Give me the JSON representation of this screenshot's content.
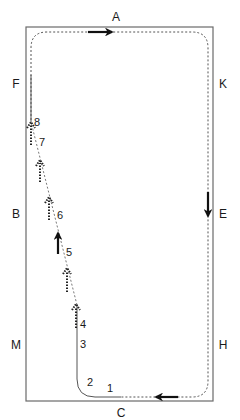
{
  "arena": {
    "letters": {
      "A": "A",
      "K": "K",
      "E": "E",
      "H": "H",
      "C": "C",
      "M": "M",
      "B": "B",
      "F": "F"
    }
  },
  "markers": {
    "m1": "1",
    "m2": "2",
    "m3": "3",
    "m4": "4",
    "m5": "5",
    "m6": "6",
    "m7": "7",
    "m8": "8"
  },
  "colors": {
    "border": "#6a6a6a",
    "path": "#555555",
    "arrow": "#111111"
  }
}
